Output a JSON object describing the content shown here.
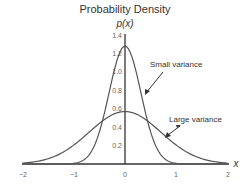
{
  "chart_data": {
    "type": "line",
    "title": "Probability Density",
    "xlabel": "x",
    "ylabel": "p(x)",
    "xlim": [
      -2,
      2
    ],
    "ylim": [
      0,
      1.4
    ],
    "x_ticks": [
      "-2",
      "-1",
      "0",
      "1",
      "2"
    ],
    "y_ticks": [
      "0.2",
      "0.4",
      "0.6",
      "0.8",
      "1.0",
      "1.2",
      "1.4"
    ],
    "grid": false,
    "legend": "none (annotations with arrows)",
    "series": [
      {
        "name": "Small variance",
        "distribution": "normal",
        "mean": 0,
        "sigma": 0.31,
        "peak": 1.28,
        "x": [
          -2,
          -1.5,
          -1,
          -0.75,
          -0.5,
          -0.25,
          0,
          0.25,
          0.5,
          0.75,
          1,
          1.5,
          2
        ],
        "values": [
          0.0,
          0.0,
          0.01,
          0.07,
          0.35,
          0.92,
          1.28,
          0.92,
          0.35,
          0.07,
          0.01,
          0.0,
          0.0
        ]
      },
      {
        "name": "Large variance",
        "distribution": "normal",
        "mean": 0,
        "sigma": 0.7,
        "peak": 0.57,
        "x": [
          -2,
          -1.5,
          -1,
          -0.75,
          -0.5,
          -0.25,
          0,
          0.25,
          0.5,
          0.75,
          1,
          1.5,
          2
        ],
        "values": [
          0.01,
          0.06,
          0.21,
          0.32,
          0.44,
          0.53,
          0.57,
          0.53,
          0.44,
          0.32,
          0.21,
          0.06,
          0.01
        ]
      }
    ],
    "annotations": [
      {
        "text": "Small variance",
        "points_to_series": "Small variance"
      },
      {
        "text": "Large variance",
        "points_to_series": "Large variance"
      }
    ]
  },
  "labels": {
    "title": "Probability Density",
    "ylabel": "p(x)",
    "xlabel": "x",
    "annotation_small": "Small variance",
    "annotation_large": "Large variance",
    "xtick_m2": "−2",
    "xtick_m1": "−1",
    "xtick_0": "0",
    "xtick_1": "1",
    "xtick_2": "2",
    "ytick_02": "0.2",
    "ytick_04": "0.4",
    "ytick_06": "0.6",
    "ytick_08": "0.8",
    "ytick_10": "1.0",
    "ytick_12": "1.2",
    "ytick_14": "1.4"
  },
  "colors": {
    "curve": "#555555",
    "axis": "#333333",
    "text": "#333333",
    "tick_text": "#666666"
  }
}
